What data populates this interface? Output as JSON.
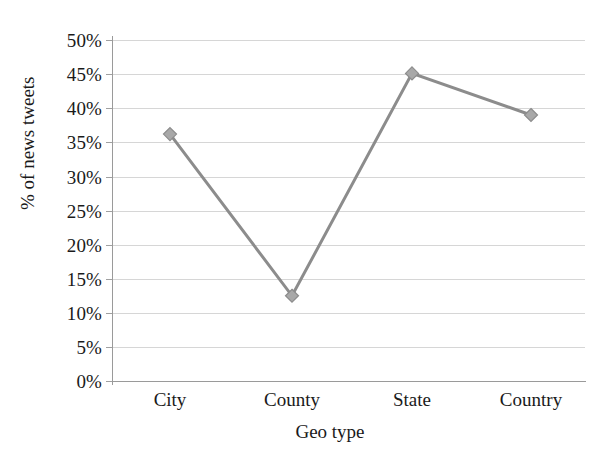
{
  "chart_data": {
    "type": "line",
    "title": "",
    "subtitle": "",
    "xlabel": "Geo type",
    "ylabel": "% of news tweets",
    "categories": [
      "City",
      "County",
      "State",
      "Country"
    ],
    "values": [
      36.2,
      12.5,
      45.1,
      39.0
    ],
    "value_labels": [
      "36.2%",
      "12.5%",
      "45.1%",
      "39.0%"
    ],
    "series": [
      {
        "name": "% of news tweets",
        "values": [
          36.2,
          12.5,
          45.1,
          39.0
        ]
      }
    ],
    "ylim": [
      0,
      50
    ],
    "xlim": [
      0,
      5
    ],
    "y_ticks": [
      0,
      5,
      10,
      15,
      20,
      25,
      30,
      35,
      40,
      45,
      50
    ],
    "y_tick_labels": [
      "0%",
      "5%",
      "10%",
      "15%",
      "20%",
      "25%",
      "30%",
      "35%",
      "40%",
      "45%",
      "50%"
    ],
    "x_tick_labels": [
      "City",
      "County",
      "State",
      "Country"
    ],
    "grid": true,
    "grid_axis": "y",
    "legend": false,
    "legend_position": "none",
    "marker": "diamond",
    "annotations": [],
    "colors": {
      "line": "#8c8c8c",
      "marker_fill": "#a8a8a8",
      "marker_edge": "#8c8c8c",
      "gridline": "#d6d6d6",
      "axis": "#9a9a9a",
      "text": "#1a1a1a",
      "background": "#ffffff"
    }
  }
}
